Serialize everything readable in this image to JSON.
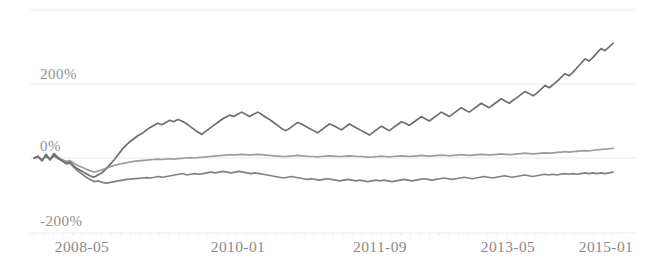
{
  "chart_data": {
    "type": "line",
    "title": "",
    "subtitle": "",
    "xlabel": "",
    "ylabel": "",
    "grid": true,
    "legend": "none",
    "ylim": [
      -200,
      400
    ],
    "yticks": [
      -200,
      0,
      200
    ],
    "ytick_labels": [
      "-200%",
      "0%",
      "200%"
    ],
    "xtick_labels": [
      "2008-05",
      "2010-01",
      "2011-09",
      "2013-05",
      "2015-01"
    ],
    "xtick_positions_px": [
      82,
      238,
      380,
      508,
      606
    ],
    "colors": {
      "series_1": "#5a5a5a",
      "series_2": "#8f8f8f",
      "series_3": "#6f6f6f",
      "grid": "#e9e9e9",
      "axis_text": "#8a8a8a",
      "background": "#ffffff"
    },
    "series": [
      {
        "name": "series-1",
        "color": "#5a5a5a",
        "values": [
          0,
          5,
          -8,
          10,
          -4,
          12,
          2,
          -6,
          -14,
          -10,
          -22,
          -30,
          -36,
          -42,
          -48,
          -52,
          -46,
          -40,
          -30,
          -18,
          -6,
          8,
          22,
          34,
          44,
          52,
          60,
          66,
          74,
          82,
          88,
          94,
          90,
          96,
          102,
          98,
          104,
          100,
          94,
          86,
          78,
          70,
          64,
          72,
          80,
          88,
          96,
          104,
          110,
          116,
          112,
          118,
          124,
          118,
          112,
          118,
          124,
          118,
          110,
          104,
          96,
          88,
          80,
          74,
          80,
          88,
          96,
          92,
          86,
          80,
          74,
          68,
          76,
          84,
          92,
          88,
          82,
          76,
          84,
          92,
          86,
          80,
          74,
          68,
          62,
          70,
          78,
          86,
          80,
          74,
          82,
          90,
          98,
          94,
          88,
          96,
          104,
          112,
          106,
          100,
          108,
          116,
          124,
          118,
          112,
          120,
          128,
          136,
          130,
          124,
          132,
          140,
          148,
          142,
          136,
          144,
          152,
          160,
          154,
          148,
          156,
          164,
          172,
          180,
          174,
          168,
          176,
          186,
          196,
          190,
          198,
          208,
          218,
          228,
          222,
          232,
          244,
          256,
          268,
          262,
          272,
          284,
          296,
          290,
          300,
          310
        ]
      },
      {
        "name": "series-2",
        "color": "#8f8f8f",
        "values": [
          0,
          2,
          -4,
          4,
          -2,
          5,
          0,
          -4,
          -9,
          -7,
          -14,
          -20,
          -25,
          -30,
          -34,
          -38,
          -35,
          -32,
          -28,
          -24,
          -20,
          -18,
          -15,
          -13,
          -11,
          -9,
          -8,
          -7,
          -6,
          -5,
          -4,
          -3,
          -4,
          -3,
          -2,
          -3,
          -2,
          -1,
          0,
          1,
          0,
          1,
          2,
          3,
          4,
          5,
          6,
          7,
          8,
          9,
          8,
          9,
          10,
          9,
          8,
          9,
          10,
          9,
          8,
          7,
          6,
          5,
          4,
          4,
          5,
          6,
          7,
          6,
          5,
          4,
          4,
          3,
          4,
          5,
          6,
          5,
          4,
          4,
          5,
          6,
          5,
          4,
          4,
          3,
          2,
          3,
          4,
          5,
          4,
          3,
          4,
          5,
          6,
          5,
          4,
          5,
          6,
          7,
          6,
          5,
          6,
          7,
          8,
          7,
          6,
          7,
          8,
          9,
          8,
          7,
          8,
          9,
          10,
          9,
          8,
          9,
          10,
          11,
          10,
          9,
          10,
          11,
          12,
          13,
          12,
          11,
          12,
          13,
          14,
          13,
          14,
          15,
          16,
          17,
          16,
          17,
          18,
          19,
          20,
          19,
          21,
          22,
          23,
          24,
          25,
          26
        ]
      },
      {
        "name": "series-3",
        "color": "#6f6f6f",
        "values": [
          0,
          3,
          -6,
          6,
          -5,
          7,
          -2,
          -8,
          -16,
          -14,
          -26,
          -36,
          -44,
          -52,
          -58,
          -64,
          -62,
          -66,
          -68,
          -66,
          -64,
          -62,
          -60,
          -58,
          -57,
          -56,
          -55,
          -54,
          -53,
          -54,
          -52,
          -50,
          -52,
          -50,
          -48,
          -46,
          -44,
          -42,
          -46,
          -44,
          -42,
          -44,
          -42,
          -40,
          -38,
          -40,
          -38,
          -36,
          -38,
          -40,
          -38,
          -36,
          -38,
          -40,
          -42,
          -40,
          -42,
          -44,
          -46,
          -48,
          -50,
          -52,
          -54,
          -52,
          -50,
          -52,
          -54,
          -56,
          -58,
          -56,
          -58,
          -60,
          -58,
          -56,
          -58,
          -60,
          -62,
          -60,
          -58,
          -60,
          -62,
          -60,
          -62,
          -64,
          -62,
          -60,
          -62,
          -60,
          -62,
          -64,
          -62,
          -60,
          -58,
          -60,
          -62,
          -60,
          -58,
          -56,
          -58,
          -60,
          -58,
          -56,
          -54,
          -56,
          -58,
          -56,
          -54,
          -52,
          -54,
          -56,
          -54,
          -52,
          -50,
          -52,
          -54,
          -52,
          -50,
          -48,
          -50,
          -52,
          -50,
          -48,
          -46,
          -48,
          -50,
          -48,
          -46,
          -44,
          -46,
          -44,
          -46,
          -44,
          -42,
          -44,
          -42,
          -44,
          -42,
          -40,
          -42,
          -40,
          -42,
          -40,
          -42,
          -40,
          -38
        ]
      }
    ]
  }
}
